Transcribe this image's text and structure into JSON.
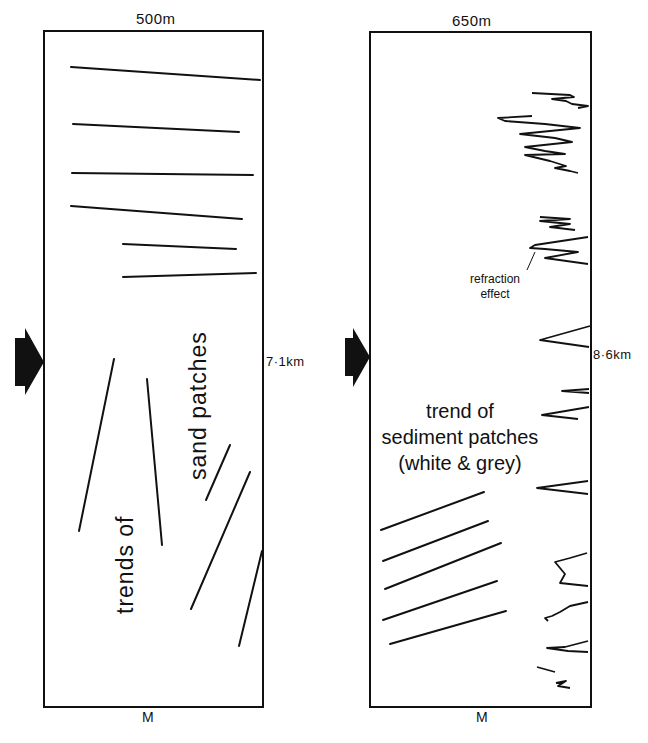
{
  "panels": [
    {
      "id": "left",
      "width_label": "500m",
      "length_label": "7·1km",
      "bottom_marker": "M",
      "vertical_text": [
        "sand patches",
        "trends of"
      ],
      "lines": [
        [
          71,
          67,
          260,
          80
        ],
        [
          73,
          124,
          239,
          132
        ],
        [
          72,
          173,
          253,
          175
        ],
        [
          71,
          206,
          242,
          219
        ],
        [
          123,
          244,
          236,
          249
        ],
        [
          123,
          277,
          256,
          273
        ],
        [
          114,
          359,
          79,
          531
        ],
        [
          147,
          379,
          162,
          545
        ],
        [
          230,
          445,
          206,
          500
        ],
        [
          250,
          472,
          191,
          609
        ],
        [
          262,
          551,
          239,
          646
        ]
      ]
    },
    {
      "id": "right",
      "width_label": "650m",
      "length_label": "8·6km",
      "bottom_marker": "M",
      "annotation": [
        "refraction",
        "effect"
      ],
      "trend_text": [
        "trend of",
        "sediment patches",
        "(white & grey)"
      ],
      "lines": [
        [
          381,
          530,
          484,
          492
        ],
        [
          383,
          561,
          488,
          521
        ],
        [
          385,
          589,
          501,
          543
        ],
        [
          383,
          620,
          497,
          581
        ],
        [
          390,
          644,
          506,
          611
        ]
      ]
    }
  ],
  "arrow_icon": "direction-arrow",
  "colors": {
    "ink": "#111111",
    "background": "#ffffff"
  }
}
